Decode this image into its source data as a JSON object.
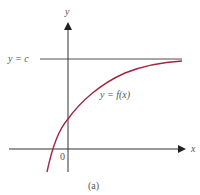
{
  "figure": {
    "subcaption": "(a)",
    "axes": {
      "x_label": "x",
      "y_label": "y",
      "origin_label": "0"
    },
    "asymptote": {
      "label": "y = c",
      "color": "#8a8a8a"
    },
    "curve": {
      "label": "y = f(x)",
      "color": "#a3253f",
      "description": "increasing concave-down curve approaching horizontal asymptote y = c from below"
    },
    "axis_color": "#333333"
  }
}
